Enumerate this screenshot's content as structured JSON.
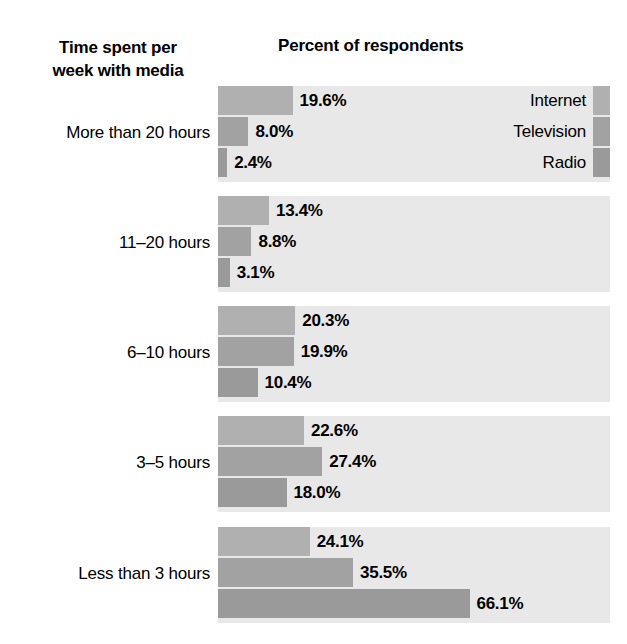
{
  "axis_title": {
    "line1": "Time spent per",
    "line2": "week with media"
  },
  "chart_title": "Percent of respondents",
  "legend": {
    "items": [
      {
        "label": "Internet",
        "color": "#b0b0b0"
      },
      {
        "label": "Television",
        "color": "#a2a2a2"
      },
      {
        "label": "Radio",
        "color": "#9a9a9a"
      }
    ]
  },
  "chart_data": {
    "type": "bar",
    "orientation": "horizontal",
    "title": "Percent of respondents",
    "xlabel": "Percent of respondents",
    "ylabel": "Time spent per week with media",
    "xlim": [
      0,
      103
    ],
    "grid": false,
    "legend_position": "inside-first-group-right",
    "categories": [
      "More than 20 hours",
      "11–20 hours",
      "6–10 hours",
      "3–5 hours",
      "Less than 3 hours"
    ],
    "series": [
      {
        "name": "Internet",
        "color": "#b0b0b0",
        "values": [
          19.6,
          13.4,
          20.3,
          22.6,
          24.1
        ]
      },
      {
        "name": "Television",
        "color": "#a2a2a2",
        "values": [
          8.0,
          8.8,
          19.9,
          27.4,
          35.5
        ]
      },
      {
        "name": "Radio",
        "color": "#9a9a9a",
        "values": [
          2.4,
          3.1,
          10.4,
          18.0,
          66.1
        ]
      }
    ],
    "data_labels": [
      [
        "19.6%",
        "8.0%",
        "2.4%"
      ],
      [
        "13.4%",
        "8.8%",
        "3.1%"
      ],
      [
        "20.3%",
        "19.9%",
        "10.4%"
      ],
      [
        "22.6%",
        "27.4%",
        "18.0%"
      ],
      [
        "24.1%",
        "35.5%",
        "66.1%"
      ]
    ]
  }
}
